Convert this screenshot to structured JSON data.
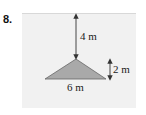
{
  "problem": {
    "number": "8.",
    "labels": {
      "height_above": "4 m",
      "triangle_height": "2 m",
      "base": "6 m"
    },
    "colors": {
      "panel": "#f1f1f1",
      "triangle_fill": "#a9a9a9",
      "line": "#333333"
    }
  }
}
